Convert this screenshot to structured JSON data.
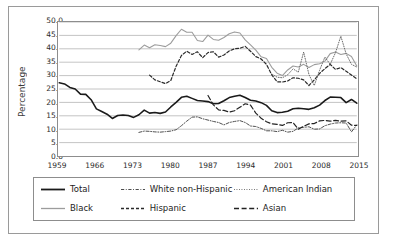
{
  "chart_data": {
    "type": "line",
    "title": "",
    "xlabel": "",
    "ylabel": "Percentage",
    "xlim": [
      1959,
      2015
    ],
    "ylim": [
      0,
      50
    ],
    "ytick_labels": [
      "50.0",
      "45.0",
      "40.0",
      "35.0",
      "30.0",
      "25.0",
      "20.0",
      "15.0",
      "10.0",
      "5.0",
      "0.0"
    ],
    "ytick_values": [
      50,
      45,
      40,
      35,
      30,
      25,
      20,
      15,
      10,
      5,
      0
    ],
    "xtick_labels": [
      "1959",
      "1966",
      "1973",
      "1980",
      "1987",
      "1994",
      "2001",
      "2008",
      "2015"
    ],
    "xtick_values": [
      1959,
      1966,
      1973,
      1980,
      1987,
      1994,
      2001,
      2008,
      2015
    ],
    "grid": "horizontal",
    "legend_position": "below",
    "series": [
      {
        "name": "Total",
        "style": "solid",
        "color": "#1a1a1a",
        "width": 1.6,
        "x": [
          1959,
          1960,
          1961,
          1962,
          1963,
          1964,
          1965,
          1966,
          1967,
          1968,
          1969,
          1970,
          1971,
          1972,
          1973,
          1974,
          1975,
          1976,
          1977,
          1978,
          1979,
          1980,
          1981,
          1982,
          1983,
          1984,
          1985,
          1986,
          1987,
          1988,
          1989,
          1990,
          1991,
          1992,
          1993,
          1994,
          1995,
          1996,
          1997,
          1998,
          1999,
          2000,
          2001,
          2002,
          2003,
          2004,
          2005,
          2006,
          2007,
          2008,
          2009,
          2010,
          2011,
          2012,
          2013,
          2014,
          2015
        ],
        "y": [
          27.3,
          26.9,
          25.6,
          25.0,
          23.1,
          23.0,
          21.0,
          17.6,
          16.6,
          15.6,
          14.0,
          15.1,
          15.3,
          15.1,
          14.4,
          15.4,
          17.1,
          16.0,
          16.2,
          15.9,
          16.4,
          18.3,
          20.0,
          21.9,
          22.3,
          21.5,
          20.7,
          20.5,
          20.3,
          19.5,
          19.6,
          20.6,
          21.8,
          22.3,
          22.7,
          21.8,
          20.8,
          20.5,
          19.9,
          18.9,
          16.9,
          16.2,
          16.3,
          16.7,
          17.6,
          17.8,
          17.6,
          17.4,
          18.0,
          19.0,
          20.7,
          22.0,
          21.9,
          21.8,
          19.9,
          21.1,
          19.7
        ]
      },
      {
        "name": "Black",
        "style": "solid",
        "color": "#9c9c9c",
        "width": 1.1,
        "x": [
          1974,
          1975,
          1976,
          1977,
          1978,
          1979,
          1980,
          1981,
          1982,
          1983,
          1984,
          1985,
          1986,
          1987,
          1988,
          1989,
          1990,
          1991,
          1992,
          1993,
          1994,
          1995,
          1996,
          1997,
          1998,
          1999,
          2000,
          2001,
          2002,
          2003,
          2004,
          2005,
          2006,
          2007,
          2008,
          2009,
          2010,
          2011,
          2012,
          2013,
          2014,
          2015
        ],
        "y": [
          39.6,
          41.4,
          40.4,
          41.5,
          41.2,
          40.8,
          42.1,
          44.9,
          47.3,
          46.2,
          46.2,
          43.1,
          42.7,
          45.1,
          43.5,
          43.2,
          44.2,
          45.6,
          46.3,
          45.9,
          43.3,
          41.5,
          39.5,
          37.0,
          36.4,
          33.1,
          30.9,
          30.0,
          32.1,
          33.6,
          33.2,
          34.2,
          33.0,
          34.1,
          34.4,
          35.4,
          38.2,
          38.8,
          37.9,
          38.3,
          37.1,
          33.6
        ]
      },
      {
        "name": "White non-Hispanic",
        "style": "dashdot",
        "color": "#4d4d4d",
        "width": 1.0,
        "x": [
          1974,
          1975,
          1976,
          1977,
          1978,
          1979,
          1980,
          1981,
          1982,
          1983,
          1984,
          1985,
          1986,
          1987,
          1988,
          1989,
          1990,
          1991,
          1992,
          1993,
          1994,
          1995,
          1996,
          1997,
          1998,
          1999,
          2000,
          2001,
          2002,
          2003,
          2004,
          2005,
          2006,
          2007,
          2008,
          2009,
          2010,
          2011,
          2012,
          2013,
          2014,
          2015
        ],
        "y": [
          8.8,
          9.3,
          9.2,
          9.0,
          8.9,
          9.1,
          9.3,
          9.8,
          11.3,
          13.0,
          14.5,
          14.6,
          13.9,
          13.4,
          12.9,
          12.5,
          11.6,
          12.5,
          12.9,
          13.2,
          12.5,
          11.2,
          11.0,
          10.3,
          9.4,
          9.4,
          9.1,
          9.6,
          8.9,
          9.2,
          10.5,
          10.7,
          10.9,
          10.0,
          10.1,
          11.3,
          11.9,
          12.3,
          12.4,
          12.3,
          9.0,
          11.6
        ]
      },
      {
        "name": "Hispanic",
        "style": "dashed",
        "color": "#2a2a2a",
        "width": 1.2,
        "x": [
          1976,
          1977,
          1978,
          1979,
          1980,
          1981,
          1982,
          1983,
          1984,
          1985,
          1986,
          1987,
          1988,
          1989,
          1990,
          1991,
          1992,
          1993,
          1994,
          1995,
          1996,
          1997,
          1998,
          1999,
          2000,
          2001,
          2002,
          2003,
          2004,
          2005,
          2006,
          2007,
          2008,
          2009,
          2010,
          2011,
          2012,
          2013,
          2014,
          2015
        ],
        "y": [
          30.2,
          28.4,
          27.7,
          27.0,
          28.2,
          33.5,
          37.5,
          39.1,
          37.9,
          38.9,
          36.7,
          38.6,
          38.9,
          36.9,
          37.7,
          39.2,
          40.0,
          40.2,
          40.9,
          39.1,
          37.1,
          36.2,
          34.2,
          30.3,
          27.7,
          27.6,
          28.0,
          29.2,
          29.0,
          28.4,
          26.3,
          28.4,
          30.8,
          32.6,
          34.2,
          32.3,
          33.0,
          31.6,
          30.2,
          28.8
        ]
      },
      {
        "name": "American Indian",
        "style": "dotted",
        "color": "#6b6b6b",
        "width": 1.0,
        "x": [
          1999,
          2000,
          2001,
          2002,
          2003,
          2004,
          2005,
          2006,
          2007,
          2008,
          2009,
          2010,
          2011,
          2012,
          2013,
          2014,
          2015
        ],
        "y": [
          30.6,
          29.4,
          29.2,
          30.3,
          32.5,
          31.3,
          38.8,
          30.4,
          26.3,
          32.0,
          36.9,
          34.2,
          38.6,
          44.7,
          38.1,
          34.2,
          33.2
        ]
      },
      {
        "name": "Asian",
        "style": "longdash",
        "color": "#222222",
        "width": 1.2,
        "x": [
          1987,
          1988,
          1989,
          1990,
          1991,
          1992,
          1993,
          1994,
          1995,
          1996,
          1997,
          1998,
          1999,
          2000,
          2001,
          2002,
          2003,
          2004,
          2005,
          2006,
          2007,
          2008,
          2009,
          2010,
          2011,
          2012,
          2013,
          2014,
          2015
        ],
        "y": [
          22.6,
          19.1,
          17.2,
          17.0,
          16.4,
          16.9,
          18.2,
          19.5,
          19.0,
          16.0,
          14.1,
          12.8,
          12.0,
          11.8,
          11.4,
          12.4,
          12.5,
          10.0,
          11.1,
          12.0,
          12.1,
          13.1,
          13.3,
          13.0,
          13.3,
          13.0,
          13.1,
          11.5,
          11.4
        ]
      }
    ]
  },
  "legend": {
    "entries": [
      {
        "label": "Total",
        "key": "total-key"
      },
      {
        "label": "White non-Hispanic",
        "key": "white-non-hispanic-key"
      },
      {
        "label": "American Indian",
        "key": "american-indian-key"
      },
      {
        "label": "Black",
        "key": "black-key"
      },
      {
        "label": "Hispanic",
        "key": "hispanic-key"
      },
      {
        "label": "Asian",
        "key": "asian-key"
      }
    ]
  }
}
